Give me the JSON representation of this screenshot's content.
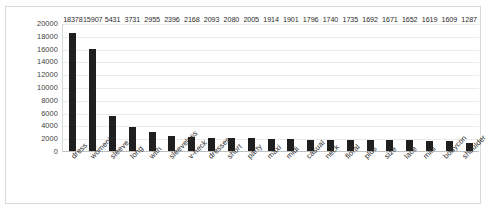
{
  "chart_data": {
    "type": "bar",
    "title": "",
    "xlabel": "",
    "ylabel": "",
    "ylim": [
      0,
      20000
    ],
    "grid": true,
    "legend": "none",
    "orientation": "vertical",
    "bar_color": "#1f1f1f",
    "gridline_color": "#ebebeb",
    "border_color": "#d9d9d9",
    "y_ticks": [
      "20000",
      "18000",
      "16000",
      "14000",
      "12000",
      "10000",
      "8000",
      "6000",
      "4000",
      "2000",
      "0"
    ],
    "y_tick_values": [
      20000,
      18000,
      16000,
      14000,
      12000,
      10000,
      8000,
      6000,
      4000,
      2000,
      0
    ],
    "categories": [
      "dress",
      "women's",
      "sleeve",
      "long",
      "with",
      "sleeveless",
      "v-neck",
      "dresses",
      "short",
      "party",
      "maxi",
      "midi",
      "casual",
      "neck",
      "floral",
      "plus",
      "size",
      "lace",
      "mini",
      "bodycon",
      "shoulder"
    ],
    "values": [
      18378,
      15907,
      5431,
      3731,
      2955,
      2396,
      2168,
      2093,
      2080,
      2005,
      1914,
      1901,
      1796,
      1740,
      1735,
      1692,
      1671,
      1652,
      1619,
      1609,
      1287
    ],
    "data_labels": [
      "18378",
      "15907",
      "5431",
      "3731",
      "2955",
      "2396",
      "2168",
      "2093",
      "2080",
      "2005",
      "1914",
      "1901",
      "1796",
      "1740",
      "1735",
      "1692",
      "1671",
      "1652",
      "1619",
      "1609",
      "1287"
    ]
  }
}
